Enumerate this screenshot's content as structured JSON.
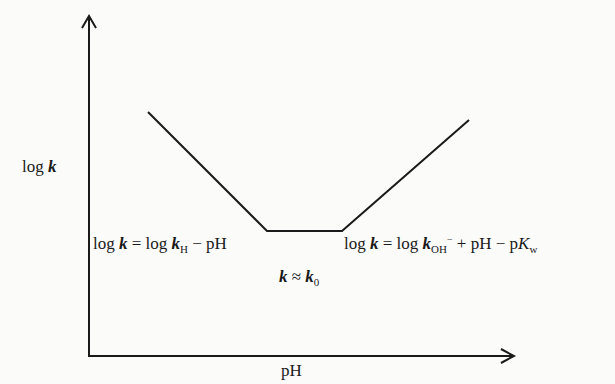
{
  "diagram": {
    "type": "pH-rate profile",
    "y_axis_label": {
      "prefix": "log ",
      "var": "k"
    },
    "x_axis_label": "pH",
    "acid_region": {
      "lhs_prefix": "log ",
      "lhs_var": "k",
      "eq": " = ",
      "rhs_log": "log ",
      "rhs_var": "k",
      "rhs_sub": "H",
      "rhs_tail": " − pH",
      "full_text": "log k = log kH − pH"
    },
    "plateau": {
      "lhs_var": "k",
      "approx": " ≈ ",
      "rhs_var": "k",
      "rhs_sub": "0",
      "full_text": "k ≈ k0"
    },
    "base_region": {
      "lhs_prefix": "log ",
      "lhs_var": "k",
      "eq": " = ",
      "rhs_log": "log ",
      "rhs_var": "k",
      "rhs_sub": "OH",
      "rhs_sup": "−",
      "rhs_mid": " + pH − p",
      "rhs_var2": "K",
      "rhs_sub2": "w",
      "full_text": "log k = log kOH− + pH − pKw"
    },
    "line_color": "#1a1a1a",
    "background": "#fbfbfa"
  },
  "geometry": {
    "y_axis": {
      "x": 89,
      "y_top": 17,
      "y_bottom": 357
    },
    "x_axis": {
      "y": 356,
      "x_left": 89,
      "x_right": 513
    },
    "curve_points": [
      [
        148,
        112
      ],
      [
        267,
        231
      ],
      [
        342,
        231
      ],
      [
        469,
        120
      ]
    ]
  }
}
